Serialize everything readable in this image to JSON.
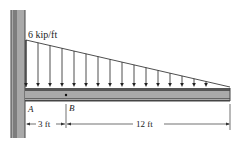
{
  "diagram": {
    "type": "cantilever beam with linearly varying distributed load",
    "load": {
      "label": "6 kip/ft",
      "max_intensity": 6,
      "unit": "kip/ft",
      "shape": "triangular, max at wall, zero at free end",
      "arrow_count": 17
    },
    "points": {
      "A": "A",
      "B": "B"
    },
    "dimensions": {
      "AB": "3 ft",
      "B_to_end": "12 ft"
    },
    "colors": {
      "wall": "#9a9a9a",
      "wall_dark": "#555555",
      "beam_fill": "#a8a8a8",
      "beam_edge": "#333333",
      "line": "#222222"
    }
  }
}
